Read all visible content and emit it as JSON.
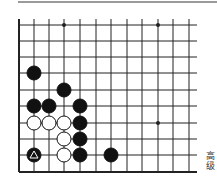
{
  "board": {
    "columns_x": [
      19,
      34,
      49,
      64,
      80,
      96,
      111,
      127,
      142,
      158,
      173,
      189
    ],
    "rows_y": [
      25,
      41,
      57,
      73,
      90,
      106,
      123,
      139,
      155,
      172
    ],
    "right_edge_x": 197,
    "star_points": [
      {
        "col": 3,
        "row": 0
      },
      {
        "col": 9,
        "row": 0
      },
      {
        "col": 9,
        "row": 6
      }
    ],
    "stones": [
      {
        "color": "black",
        "col": 1,
        "row": 3
      },
      {
        "color": "black",
        "col": 3,
        "row": 4
      },
      {
        "color": "black",
        "col": 1,
        "row": 5
      },
      {
        "color": "black",
        "col": 2,
        "row": 5
      },
      {
        "color": "black",
        "col": 4,
        "row": 5
      },
      {
        "color": "white",
        "col": 1,
        "row": 6
      },
      {
        "color": "white",
        "col": 2,
        "row": 6
      },
      {
        "color": "white",
        "col": 3,
        "row": 6
      },
      {
        "color": "black",
        "col": 4,
        "row": 6
      },
      {
        "color": "white",
        "col": 3,
        "row": 7
      },
      {
        "color": "black",
        "col": 4,
        "row": 7
      },
      {
        "color": "black",
        "col": 1,
        "row": 8,
        "mark": "triangle"
      },
      {
        "color": "white",
        "col": 3,
        "row": 8
      },
      {
        "color": "black",
        "col": 4,
        "row": 8
      },
      {
        "color": "black",
        "col": 6,
        "row": 8
      }
    ],
    "colors": {
      "line": "#222222",
      "black_stone": "#111111",
      "white_stone": "#ffffff",
      "mark": "#ffffff"
    }
  },
  "caption": {
    "text": "高级"
  }
}
